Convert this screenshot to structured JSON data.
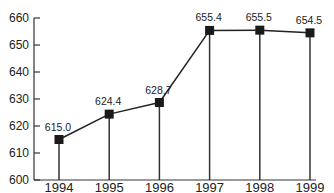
{
  "chart_data": {
    "type": "line",
    "title": "",
    "xlabel": "",
    "ylabel": "",
    "categories": [
      "1994",
      "1995",
      "1996",
      "1997",
      "1998",
      "1999"
    ],
    "series": [
      {
        "name": "value",
        "values": [
          615.0,
          624.4,
          628.7,
          655.4,
          655.5,
          654.5
        ],
        "labels": [
          "615.0",
          "624.4",
          "628.7",
          "655.4",
          "655.5",
          "654.5"
        ]
      }
    ],
    "ylim": [
      600,
      660
    ],
    "yticks": [
      600,
      610,
      620,
      630,
      640,
      650,
      660
    ],
    "ytick_labels": [
      "600",
      "610",
      "620",
      "630",
      "640",
      "650",
      "660"
    ],
    "grid": false,
    "legend": "none",
    "marker": "square",
    "drop_lines": true,
    "colors": {
      "line": "#222222",
      "marker": "#1a1a1a",
      "axis": "#333333"
    }
  }
}
